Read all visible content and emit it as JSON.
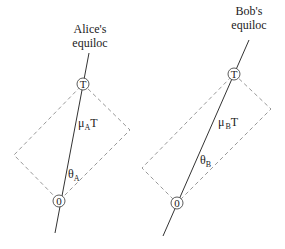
{
  "diagram": {
    "left": {
      "title_line1": "Alice's",
      "title_line2": "equiloc",
      "top_node": "T",
      "bottom_node": "0",
      "length_label_main": "μ",
      "length_label_sub": "A",
      "length_label_tail": "T",
      "angle_label_main": "θ",
      "angle_label_sub": "A"
    },
    "right": {
      "title_line1": "Bob's",
      "title_line2": "equiloc",
      "top_node": "T",
      "bottom_node": "0",
      "length_label_main": "μ",
      "length_label_sub": "B",
      "length_label_tail": "T",
      "angle_label_main": "θ",
      "angle_label_sub": "B"
    }
  },
  "colors": {
    "line": "#333333",
    "dashed": "#999999"
  }
}
